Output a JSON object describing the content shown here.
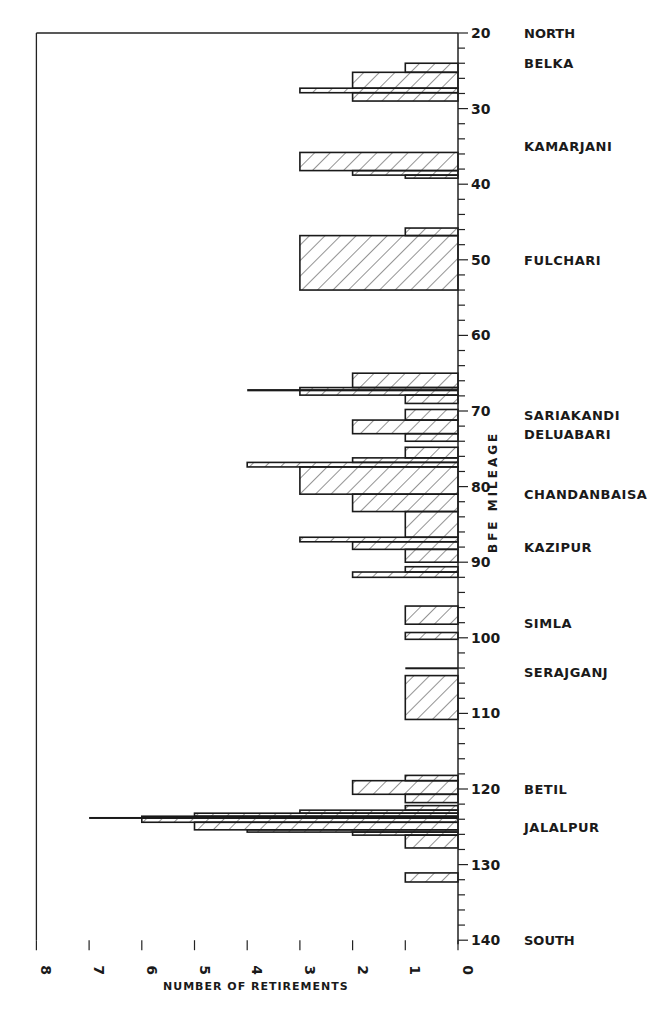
{
  "chart_data": {
    "type": "bar",
    "orientation": "horizontal-histogram",
    "title": "",
    "xlabel": "NUMBER OF RETIREMENTS",
    "ylabel": "BFE MILEAGE",
    "xlim": [
      8,
      0
    ],
    "ylim": [
      20,
      140
    ],
    "x_ticks": [
      8,
      7,
      6,
      5,
      4,
      3,
      2,
      1,
      0
    ],
    "y_tick_labels": [
      20,
      30,
      40,
      50,
      60,
      70,
      80,
      90,
      100,
      110,
      120,
      130,
      140
    ],
    "y_minor_tick_step": 2,
    "grid": false,
    "direction_labels": {
      "top": "NORTH",
      "bottom": "SOUTH"
    },
    "locations": [
      {
        "name": "BELKA",
        "mile": 24
      },
      {
        "name": "KAMARJANI",
        "mile": 35
      },
      {
        "name": "FULCHARI",
        "mile": 50
      },
      {
        "name": "SARIAKANDI",
        "mile": 70.5
      },
      {
        "name": "DELUABARI",
        "mile": 73
      },
      {
        "name": "CHANDANBAISA",
        "mile": 81
      },
      {
        "name": "KAZIPUR",
        "mile": 88
      },
      {
        "name": "SIMLA",
        "mile": 98
      },
      {
        "name": "SERAJGANJ",
        "mile": 104.5
      },
      {
        "name": "BETIL",
        "mile": 120
      },
      {
        "name": "JALALPUR",
        "mile": 125
      }
    ],
    "segments": [
      {
        "from": 24,
        "to": 25.2,
        "value": 1
      },
      {
        "from": 25.2,
        "to": 27.3,
        "value": 2
      },
      {
        "from": 27.3,
        "to": 27.9,
        "value": 3
      },
      {
        "from": 27.9,
        "to": 29,
        "value": 2
      },
      {
        "from": 35.8,
        "to": 38.2,
        "value": 3
      },
      {
        "from": 38.2,
        "to": 38.8,
        "value": 2
      },
      {
        "from": 38.8,
        "to": 39.2,
        "value": 1
      },
      {
        "from": 45.8,
        "to": 46.8,
        "value": 1
      },
      {
        "from": 46.8,
        "to": 54,
        "value": 3
      },
      {
        "from": 65,
        "to": 66.9,
        "value": 2
      },
      {
        "from": 66.9,
        "to": 67.9,
        "value": 3
      },
      {
        "from": 67.1,
        "to": 67.4,
        "value": 4,
        "line": true
      },
      {
        "from": 67.9,
        "to": 69,
        "value": 1
      },
      {
        "from": 69.8,
        "to": 71.2,
        "value": 1
      },
      {
        "from": 71.2,
        "to": 73,
        "value": 2
      },
      {
        "from": 73,
        "to": 74,
        "value": 1
      },
      {
        "from": 74.8,
        "to": 76.2,
        "value": 1
      },
      {
        "from": 76.2,
        "to": 76.8,
        "value": 2
      },
      {
        "from": 76.8,
        "to": 77.4,
        "value": 4
      },
      {
        "from": 77.4,
        "to": 81,
        "value": 3
      },
      {
        "from": 81,
        "to": 83.3,
        "value": 2
      },
      {
        "from": 83.3,
        "to": 86.7,
        "value": 1
      },
      {
        "from": 86.7,
        "to": 87.3,
        "value": 3
      },
      {
        "from": 87.3,
        "to": 88.3,
        "value": 2
      },
      {
        "from": 88.3,
        "to": 90,
        "value": 1
      },
      {
        "from": 90.6,
        "to": 91.3,
        "value": 1
      },
      {
        "from": 91.3,
        "to": 92,
        "value": 2
      },
      {
        "from": 95.8,
        "to": 98.2,
        "value": 1
      },
      {
        "from": 99.3,
        "to": 100.2,
        "value": 1
      },
      {
        "from": 103.9,
        "to": 104.05,
        "value": 1,
        "line": true
      },
      {
        "from": 105,
        "to": 110.8,
        "value": 1
      },
      {
        "from": 118.2,
        "to": 118.9,
        "value": 1
      },
      {
        "from": 118.9,
        "to": 120.7,
        "value": 2
      },
      {
        "from": 120.7,
        "to": 121.8,
        "value": 1
      },
      {
        "from": 122.2,
        "to": 122.8,
        "value": 1
      },
      {
        "from": 122.8,
        "to": 123.2,
        "value": 3
      },
      {
        "from": 123.2,
        "to": 123.6,
        "value": 5
      },
      {
        "from": 123.6,
        "to": 123.8,
        "value": 6
      },
      {
        "from": 123.7,
        "to": 123.9,
        "value": 7,
        "line": true
      },
      {
        "from": 123.8,
        "to": 124.4,
        "value": 6
      },
      {
        "from": 124.4,
        "to": 125.4,
        "value": 5
      },
      {
        "from": 125.4,
        "to": 125.7,
        "value": 4
      },
      {
        "from": 125.7,
        "to": 126.1,
        "value": 2
      },
      {
        "from": 126.1,
        "to": 127.8,
        "value": 1
      },
      {
        "from": 131.1,
        "to": 132.3,
        "value": 1
      }
    ]
  }
}
